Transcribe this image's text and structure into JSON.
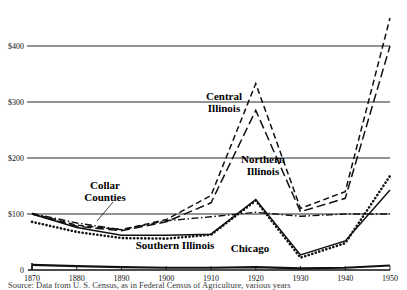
{
  "chart_data": {
    "type": "line",
    "title": "",
    "xlabel": "",
    "ylabel": "",
    "x": [
      1870,
      1880,
      1890,
      1900,
      1910,
      1920,
      1930,
      1940,
      1950
    ],
    "xlim": [
      1870,
      1950
    ],
    "ylim": [
      0,
      450
    ],
    "yticks": [
      0,
      100,
      200,
      300,
      400
    ],
    "ytick_labels": [
      "0",
      "$100",
      "$200",
      "$300",
      "$400"
    ],
    "xtick_labels": [
      "1870",
      "1880",
      "1890",
      "1900",
      "1910",
      "1920",
      "1930",
      "1940",
      "1950"
    ],
    "grid": true,
    "legend_position": "inline-annotations",
    "series": [
      {
        "name": "Central Illinois",
        "style": "dashed",
        "label_text_line1": "Central",
        "label_text_line2": "Illinois",
        "values": [
          101,
          80,
          72,
          90,
          133,
          333,
          110,
          140,
          450
        ]
      },
      {
        "name": "Northern Illinois",
        "style": "dashed-long",
        "label_text_line1": "Northern",
        "label_text_line2": "Illinois",
        "values": [
          100,
          78,
          70,
          86,
          120,
          285,
          104,
          128,
          400
        ]
      },
      {
        "name": "Collar Counties",
        "style": "dash-dot",
        "label_text_line1": "Collar",
        "label_text_line2": "Counties",
        "values": [
          101,
          84,
          72,
          88,
          95,
          103,
          96,
          100,
          100
        ]
      },
      {
        "name": "Southern Illinois",
        "style": "dotted",
        "label_text_line1": "Southern Illinois",
        "label_text_line2": "",
        "values": [
          86,
          68,
          57,
          56,
          63,
          124,
          22,
          48,
          168
        ]
      },
      {
        "name": "Chicago",
        "style": "solid-thick",
        "label_text_line1": "Chicago",
        "label_text_line2": "",
        "values": [
          9,
          7,
          5,
          4,
          4,
          5,
          3,
          4,
          8
        ]
      },
      {
        "name": "Collar Counties Solid",
        "style": "solid",
        "label_text_line1": "",
        "label_text_line2": "",
        "values": [
          100,
          76,
          62,
          62,
          64,
          126,
          27,
          52,
          143
        ]
      }
    ],
    "annotations": [
      {
        "text": "Central Illinois",
        "x": 1918,
        "y": 260
      },
      {
        "text": "Northern Illinois",
        "x": 1925,
        "y": 175
      },
      {
        "text": "Collar Counties",
        "x": 1884,
        "y": 130
      },
      {
        "text": "Southern Illinois",
        "x": 1902,
        "y": 30
      },
      {
        "text": "Chicago",
        "x": 1922,
        "y": 28
      }
    ]
  },
  "labels": {
    "central_l1": "Central",
    "central_l2": "Illinois",
    "northern_l1": "Northern",
    "northern_l2": "Illinois",
    "collar_l1": "Collar",
    "collar_l2": "Counties",
    "southern": "Southern  Illinois",
    "chicago": "Chicago"
  },
  "axis": {
    "y": [
      "$400",
      "$300",
      "$200",
      "$100",
      "0"
    ],
    "x": [
      "1870",
      "1880",
      "1890",
      "1900",
      "1910",
      "1920",
      "1930",
      "1940",
      "1950"
    ]
  },
  "caption": {
    "text": "Source: Data from U. S. Census, as in Federal Census of Agriculture, various years"
  },
  "colors": {
    "ink": "#111111",
    "background": "#ffffff"
  }
}
